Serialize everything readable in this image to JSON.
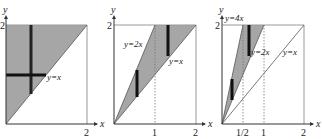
{
  "figure": {
    "colors": {
      "region_fill": "#a6a6a6",
      "axis": "#333333",
      "bar": "#111111",
      "box": "#999999",
      "dashed": "#777777"
    },
    "panels": [
      {
        "axis_x_label": "x",
        "axis_y_label": "y",
        "x_ticks": [
          "2"
        ],
        "y_ticks": [
          "2"
        ],
        "line_labels": [
          "y=x"
        ]
      },
      {
        "axis_x_label": "x",
        "axis_y_label": "y",
        "x_ticks": [
          "1",
          "2"
        ],
        "y_ticks": [
          "2"
        ],
        "line_labels": [
          "y=2x",
          "y=x"
        ]
      },
      {
        "axis_x_label": "x",
        "axis_y_label": "y",
        "x_ticks": [
          "1/2",
          "1",
          "2"
        ],
        "y_ticks": [
          "2"
        ],
        "line_labels": [
          "y=4x",
          "y=2x",
          "y=x"
        ]
      }
    ]
  }
}
